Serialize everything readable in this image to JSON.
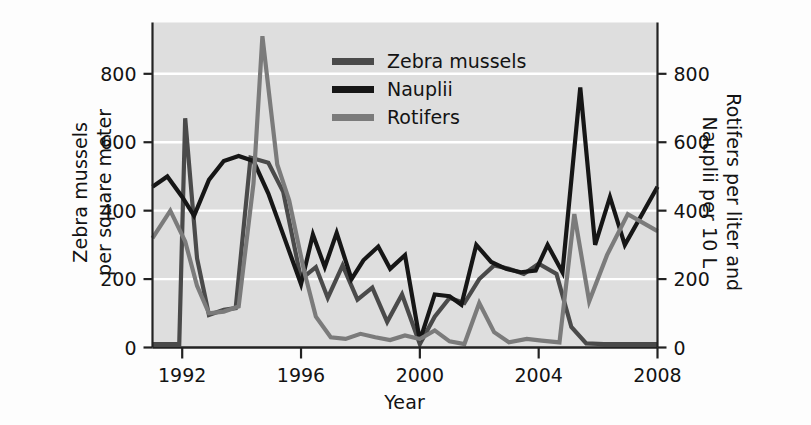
{
  "chart_data": {
    "type": "line",
    "title": "",
    "xlabel": "Year",
    "ylabel": "Zebra mussels\nper square meter",
    "ylabel_right": "Rotifers per liter and\nNauplii per 10 L",
    "xlim": [
      1991,
      2008
    ],
    "ylim": [
      0,
      950
    ],
    "ylim_right": [
      0,
      950
    ],
    "xticks": [
      1992,
      1996,
      2000,
      2004,
      2008
    ],
    "xticklabels": [
      "1992",
      "1996",
      "2000",
      "2004",
      "2008"
    ],
    "yticks": [
      0,
      200,
      400,
      600,
      800
    ],
    "yticklabels": [
      "0",
      "200",
      "400",
      "600",
      "800"
    ],
    "yticks_right": [
      0,
      200,
      400,
      600,
      800
    ],
    "yticklabels_right": [
      "0",
      "200",
      "400",
      "600",
      "800"
    ],
    "grid": true,
    "grid_color": "#ffffff",
    "plot_background": "#dedede",
    "legend_position": "upper-center",
    "x": [
      1991,
      1991.5,
      1992,
      1992.5,
      1993,
      1993.5,
      1994,
      1994.5,
      1995,
      1995.5,
      1996,
      1996.5,
      1997,
      1997.5,
      1998,
      1998.5,
      1999,
      1999.5,
      2000,
      2000.5,
      2001,
      2001.5,
      2002,
      2002.5,
      2003,
      2003.5,
      2004,
      2004.5,
      2005,
      2005.5,
      2006,
      2006.5,
      2007,
      2007.5,
      2008
    ],
    "series": [
      {
        "name": "Zebra mussels",
        "color": "#4a4a4a",
        "axis": "left",
        "values": [
          10,
          10,
          10,
          670,
          260,
          95,
          110,
          115,
          555,
          540,
          455,
          200,
          235,
          145,
          240,
          140,
          175,
          75,
          155,
          10,
          90,
          145,
          130,
          200,
          240,
          230,
          215,
          245,
          215,
          60,
          12,
          10,
          10,
          10,
          10
        ]
      },
      {
        "name": "Nauplii",
        "color": "#161616",
        "axis": "right",
        "values": [
          470,
          480,
          500,
          440,
          385,
          490,
          545,
          560,
          545,
          530,
          450,
          330,
          185,
          330,
          235,
          335,
          200,
          255,
          295,
          230,
          270,
          20,
          155,
          150,
          125,
          300,
          250,
          230,
          220,
          225,
          300,
          220,
          760,
          300,
          470
        ]
      },
      {
        "name": "Rotifers",
        "color": "#7b7b7b",
        "axis": "right",
        "values": [
          320,
          350,
          400,
          310,
          180,
          100,
          105,
          120,
          480,
          910,
          535,
          430,
          225,
          90,
          30,
          25,
          40,
          30,
          22,
          35,
          25,
          18,
          10,
          50,
          45,
          15,
          35,
          90,
          130,
          40,
          25,
          20,
          390,
          135,
          340
        ]
      }
    ],
    "series_points": {
      "Zebra mussels": [
        {
          "x": 1991.0,
          "y": 10
        },
        {
          "x": 1991.4,
          "y": 10
        },
        {
          "x": 1991.9,
          "y": 10
        },
        {
          "x": 1992.1,
          "y": 670
        },
        {
          "x": 1992.5,
          "y": 260
        },
        {
          "x": 1992.9,
          "y": 95
        },
        {
          "x": 1993.4,
          "y": 110
        },
        {
          "x": 1993.8,
          "y": 115
        },
        {
          "x": 1994.3,
          "y": 555
        },
        {
          "x": 1994.9,
          "y": 540
        },
        {
          "x": 1995.4,
          "y": 455
        },
        {
          "x": 1996.0,
          "y": 200
        },
        {
          "x": 1996.5,
          "y": 235
        },
        {
          "x": 1996.9,
          "y": 145
        },
        {
          "x": 1997.4,
          "y": 240
        },
        {
          "x": 1997.9,
          "y": 140
        },
        {
          "x": 1998.4,
          "y": 175
        },
        {
          "x": 1998.9,
          "y": 75
        },
        {
          "x": 1999.4,
          "y": 155
        },
        {
          "x": 2000.0,
          "y": 10
        },
        {
          "x": 2000.5,
          "y": 90
        },
        {
          "x": 2001.0,
          "y": 145
        },
        {
          "x": 2001.5,
          "y": 130
        },
        {
          "x": 2002.0,
          "y": 200
        },
        {
          "x": 2002.5,
          "y": 240
        },
        {
          "x": 2003.0,
          "y": 230
        },
        {
          "x": 2003.5,
          "y": 215
        },
        {
          "x": 2004.0,
          "y": 245
        },
        {
          "x": 2004.6,
          "y": 215
        },
        {
          "x": 2005.1,
          "y": 60
        },
        {
          "x": 2005.6,
          "y": 12
        },
        {
          "x": 2006.2,
          "y": 10
        },
        {
          "x": 2007.0,
          "y": 10
        },
        {
          "x": 2008.0,
          "y": 10
        }
      ],
      "Nauplii": [
        {
          "x": 1991.0,
          "y": 470
        },
        {
          "x": 1991.5,
          "y": 500
        },
        {
          "x": 1992.0,
          "y": 440
        },
        {
          "x": 1992.4,
          "y": 385
        },
        {
          "x": 1992.9,
          "y": 490
        },
        {
          "x": 1993.4,
          "y": 545
        },
        {
          "x": 1993.9,
          "y": 560
        },
        {
          "x": 1994.4,
          "y": 545
        },
        {
          "x": 1994.9,
          "y": 450
        },
        {
          "x": 1995.4,
          "y": 330
        },
        {
          "x": 1996.0,
          "y": 185
        },
        {
          "x": 1996.4,
          "y": 330
        },
        {
          "x": 1996.8,
          "y": 235
        },
        {
          "x": 1997.2,
          "y": 335
        },
        {
          "x": 1997.7,
          "y": 200
        },
        {
          "x": 1998.1,
          "y": 255
        },
        {
          "x": 1998.6,
          "y": 295
        },
        {
          "x": 1999.0,
          "y": 230
        },
        {
          "x": 1999.5,
          "y": 270
        },
        {
          "x": 2000.0,
          "y": 20
        },
        {
          "x": 2000.5,
          "y": 155
        },
        {
          "x": 2001.0,
          "y": 150
        },
        {
          "x": 2001.4,
          "y": 125
        },
        {
          "x": 2001.9,
          "y": 300
        },
        {
          "x": 2002.4,
          "y": 250
        },
        {
          "x": 2002.9,
          "y": 230
        },
        {
          "x": 2003.4,
          "y": 220
        },
        {
          "x": 2003.9,
          "y": 225
        },
        {
          "x": 2004.3,
          "y": 300
        },
        {
          "x": 2004.8,
          "y": 220
        },
        {
          "x": 2005.4,
          "y": 760
        },
        {
          "x": 2005.9,
          "y": 300
        },
        {
          "x": 2006.4,
          "y": 440
        },
        {
          "x": 2006.9,
          "y": 300
        },
        {
          "x": 2008.0,
          "y": 470
        }
      ],
      "Rotifers": [
        {
          "x": 1991.0,
          "y": 320
        },
        {
          "x": 1991.6,
          "y": 400
        },
        {
          "x": 1992.1,
          "y": 310
        },
        {
          "x": 1992.5,
          "y": 180
        },
        {
          "x": 1992.9,
          "y": 100
        },
        {
          "x": 1993.4,
          "y": 105
        },
        {
          "x": 1993.9,
          "y": 120
        },
        {
          "x": 1994.4,
          "y": 480
        },
        {
          "x": 1994.7,
          "y": 910
        },
        {
          "x": 1995.2,
          "y": 535
        },
        {
          "x": 1995.6,
          "y": 430
        },
        {
          "x": 1996.1,
          "y": 225
        },
        {
          "x": 1996.5,
          "y": 90
        },
        {
          "x": 1997.0,
          "y": 30
        },
        {
          "x": 1997.5,
          "y": 25
        },
        {
          "x": 1998.0,
          "y": 40
        },
        {
          "x": 1998.5,
          "y": 30
        },
        {
          "x": 1999.0,
          "y": 22
        },
        {
          "x": 1999.5,
          "y": 35
        },
        {
          "x": 2000.0,
          "y": 25
        },
        {
          "x": 2000.5,
          "y": 50
        },
        {
          "x": 2001.0,
          "y": 18
        },
        {
          "x": 2001.5,
          "y": 10
        },
        {
          "x": 2002.0,
          "y": 130
        },
        {
          "x": 2002.5,
          "y": 45
        },
        {
          "x": 2003.0,
          "y": 15
        },
        {
          "x": 2003.6,
          "y": 25
        },
        {
          "x": 2004.1,
          "y": 20
        },
        {
          "x": 2004.7,
          "y": 15
        },
        {
          "x": 2005.2,
          "y": 390
        },
        {
          "x": 2005.7,
          "y": 135
        },
        {
          "x": 2006.3,
          "y": 270
        },
        {
          "x": 2007.0,
          "y": 390
        },
        {
          "x": 2008.0,
          "y": 340
        }
      ]
    },
    "legend": [
      {
        "label": "Zebra mussels",
        "color": "#4a4a4a"
      },
      {
        "label": "Nauplii",
        "color": "#161616"
      },
      {
        "label": "Rotifers",
        "color": "#7b7b7b"
      }
    ]
  }
}
